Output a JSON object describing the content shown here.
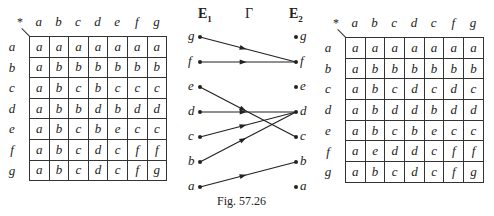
{
  "figure": {
    "caption": "Fig. 57.26",
    "left_table": {
      "corner": "*",
      "col_headers": [
        "a",
        "b",
        "c",
        "d",
        "e",
        "f",
        "g"
      ],
      "row_headers": [
        "a",
        "b",
        "c",
        "d",
        "e",
        "f",
        "g"
      ],
      "rows": [
        [
          "a",
          "a",
          "a",
          "a",
          "a",
          "a",
          "a"
        ],
        [
          "a",
          "b",
          "b",
          "b",
          "b",
          "b",
          "b"
        ],
        [
          "a",
          "b",
          "c",
          "b",
          "c",
          "c",
          "c"
        ],
        [
          "a",
          "b",
          "b",
          "d",
          "b",
          "d",
          "d"
        ],
        [
          "a",
          "b",
          "c",
          "b",
          "e",
          "c",
          "c"
        ],
        [
          "a",
          "b",
          "c",
          "d",
          "c",
          "f",
          "f"
        ],
        [
          "a",
          "b",
          "c",
          "d",
          "c",
          "f",
          "g"
        ]
      ]
    },
    "mapping": {
      "domain_label": "E",
      "domain_sub": "1",
      "map_label": "Γ",
      "codomain_label": "E",
      "codomain_sub": "2",
      "domain_nodes": [
        "g",
        "f",
        "e",
        "d",
        "c",
        "b",
        "a"
      ],
      "codomain_nodes": [
        "g",
        "f",
        "e",
        "d",
        "c",
        "b",
        "a"
      ],
      "arrows": [
        {
          "from": "g",
          "to": "f"
        },
        {
          "from": "f",
          "to": "f"
        },
        {
          "from": "e",
          "to": "c"
        },
        {
          "from": "d",
          "to": "d"
        },
        {
          "from": "c",
          "to": "d"
        },
        {
          "from": "b",
          "to": "d"
        },
        {
          "from": "a",
          "to": "b"
        }
      ]
    },
    "right_table": {
      "corner": "*",
      "col_headers": [
        "a",
        "b",
        "c",
        "d",
        "c",
        "f",
        "g"
      ],
      "row_headers": [
        "a",
        "b",
        "c",
        "d",
        "e",
        "f",
        "g"
      ],
      "rows": [
        [
          "a",
          "a",
          "a",
          "a",
          "a",
          "a",
          "a"
        ],
        [
          "a",
          "b",
          "b",
          "b",
          "b",
          "b",
          "b"
        ],
        [
          "a",
          "b",
          "c",
          "d",
          "c",
          "d",
          "c"
        ],
        [
          "a",
          "b",
          "d",
          "d",
          "b",
          "d",
          "d"
        ],
        [
          "a",
          "b",
          "c",
          "b",
          "e",
          "c",
          "c"
        ],
        [
          "a",
          "e",
          "d",
          "d",
          "c",
          "f",
          "f"
        ],
        [
          "a",
          "b",
          "c",
          "d",
          "c",
          "f",
          "g"
        ]
      ]
    }
  }
}
